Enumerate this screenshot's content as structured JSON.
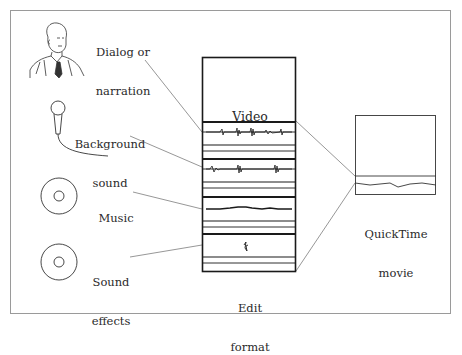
{
  "diagram": {
    "title": "",
    "sources": [
      {
        "id": "dialog",
        "label_line1": "Dialog or",
        "label_line2": "narration",
        "icon": "person-icon"
      },
      {
        "id": "background",
        "label_line1": "Background",
        "label_line2": "sound",
        "icon": "microphone-icon"
      },
      {
        "id": "music",
        "label_line1": "Music",
        "label_line2": "",
        "icon": "disc-icon"
      },
      {
        "id": "effects",
        "label_line1": "Sound",
        "label_line2": "effects",
        "icon": "disc-icon"
      }
    ],
    "edit_format": {
      "video_label": "Video",
      "caption_line1": "Edit",
      "caption_line2": "format",
      "tracks": [
        "Dialog or narration",
        "Background sound",
        "Music",
        "Sound effects"
      ]
    },
    "output": {
      "caption_line1": "QuickTime",
      "caption_line2": "movie"
    },
    "colors": {
      "border": "#9a9a9a",
      "line": "#1a1a1a",
      "leader": "#6a6a6a"
    }
  }
}
